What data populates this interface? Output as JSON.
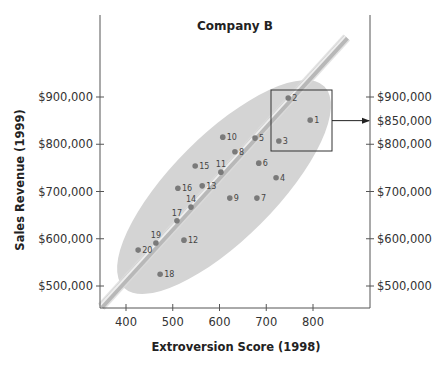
{
  "chart_data": {
    "type": "scatter",
    "title": "Company B",
    "xlabel": "Extroversion Score (1998)",
    "ylabel": "Sales Revenue (1999)",
    "xlim": [
      345,
      845
    ],
    "ylim": [
      455000,
      1075000
    ],
    "x_ticks": [
      400,
      500,
      600,
      700,
      800
    ],
    "x_tick_labels": [
      "400",
      "500",
      "600",
      "700",
      "800"
    ],
    "y_ticks": [
      500000,
      600000,
      700000,
      800000,
      900000
    ],
    "y_tick_labels": [
      "$500,000",
      "$600,000",
      "$700,000",
      "$800,000",
      "$900,000"
    ],
    "right_y_ticks": [
      500000,
      600000,
      700000,
      800000,
      850000,
      900000
    ],
    "right_y_tick_labels": [
      "$500,000",
      "$600,000",
      "$700,000",
      "$800,000",
      "$850,000",
      "$900,000"
    ],
    "grid": false,
    "legend": null,
    "points": [
      {
        "label": "1",
        "x": 794,
        "y": 851000
      },
      {
        "label": "2",
        "x": 747,
        "y": 898000
      },
      {
        "label": "3",
        "x": 727,
        "y": 807000
      },
      {
        "label": "4",
        "x": 721,
        "y": 729000
      },
      {
        "label": "5",
        "x": 676,
        "y": 813000
      },
      {
        "label": "6",
        "x": 684,
        "y": 760000
      },
      {
        "label": "7",
        "x": 680,
        "y": 686000
      },
      {
        "label": "8",
        "x": 633,
        "y": 784000
      },
      {
        "label": "9",
        "x": 622,
        "y": 686000
      },
      {
        "label": "10",
        "x": 607,
        "y": 815000
      },
      {
        "label": "11",
        "x": 603,
        "y": 741000
      },
      {
        "label": "12",
        "x": 524,
        "y": 597000
      },
      {
        "label": "13",
        "x": 563,
        "y": 712000
      },
      {
        "label": "14",
        "x": 539,
        "y": 667000
      },
      {
        "label": "15",
        "x": 548,
        "y": 754000
      },
      {
        "label": "16",
        "x": 511,
        "y": 707000
      },
      {
        "label": "17",
        "x": 509,
        "y": 638000
      },
      {
        "label": "18",
        "x": 473,
        "y": 525000
      },
      {
        "label": "19",
        "x": 464,
        "y": 591000
      },
      {
        "label": "20",
        "x": 426,
        "y": 576000
      }
    ],
    "regression_line": {
      "x1": 347,
      "y1": 456000,
      "x2": 872,
      "y2": 1026000
    },
    "annotations": [
      {
        "type": "highlight-box",
        "around_points": [
          "1",
          "2",
          "3"
        ],
        "arrow_to_right_axis": "$850,000"
      },
      {
        "type": "ellipse",
        "description": "shaded ellipse enclosing all data points"
      }
    ]
  },
  "colors": {
    "ellipse_fill": "#d4d4d4",
    "point": "#7a7a7a",
    "axis": "#555555",
    "line_core": "#b8b8b8",
    "line_highlight": "#eeeeee"
  },
  "label_positions": {
    "left_of_point": [
      "11",
      "14",
      "17",
      "19"
    ],
    "above_point": [
      "11",
      "14",
      "17",
      "19"
    ]
  }
}
